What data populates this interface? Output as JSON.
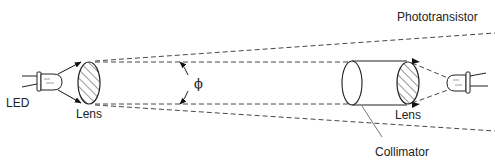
{
  "diagram": {
    "type": "optical-setup",
    "labels": {
      "led": "LED",
      "lens_left": "Lens",
      "lens_right": "Lens",
      "phototransistor": "Phototransistor",
      "collimator": "Collimator",
      "angle": "ϕ"
    },
    "components": [
      {
        "id": "led",
        "kind": "emitter",
        "label": "LED"
      },
      {
        "id": "lens-left",
        "kind": "lens",
        "label": "Lens"
      },
      {
        "id": "collimator",
        "kind": "cylinder",
        "label": "Collimator"
      },
      {
        "id": "lens-right",
        "kind": "lens",
        "label": "Lens"
      },
      {
        "id": "phototransistor",
        "kind": "detector",
        "label": "Phototransistor"
      }
    ],
    "annotations": [
      {
        "id": "beam-divergence-angle",
        "symbol": "ϕ"
      }
    ],
    "colors": {
      "stroke": "#222222",
      "dash": "#333333",
      "background": "#ffffff"
    }
  }
}
